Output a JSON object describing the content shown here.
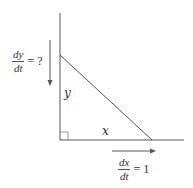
{
  "diagram": {
    "labels": {
      "side_vertical": "y",
      "side_horizontal": "x"
    },
    "rate_y": {
      "numerator": "dy",
      "denominator": "dt",
      "rhs": "= ?"
    },
    "rate_x": {
      "numerator": "dx",
      "denominator": "dt",
      "rhs": "= 1"
    },
    "colors": {
      "line": "#555555",
      "text": "#333333",
      "background": "#ffffff"
    }
  }
}
